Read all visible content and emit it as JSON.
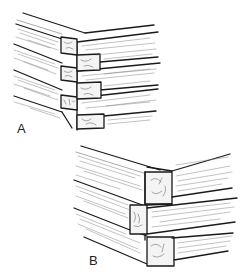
{
  "figure": {
    "panels": [
      {
        "id": "A",
        "label": "A",
        "joint": "notched log corner with alternating projecting ends",
        "courses": 3
      },
      {
        "id": "B",
        "label": "B",
        "joint": "squared timber corner with overlapping ends",
        "courses": 3
      }
    ]
  },
  "colors": {
    "line": "#1a1a1a",
    "background": "#ffffff"
  }
}
